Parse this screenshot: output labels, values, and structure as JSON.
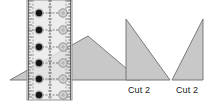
{
  "canvas": {
    "width": 215,
    "height": 106,
    "background": "#ffffff"
  },
  "palette": {
    "piece_fill": "#c8c8c8",
    "piece_stroke": "#6e6e6e",
    "ruler_fill": "#e9e9e9",
    "ruler_stroke": "#8d8d8d",
    "ruler_tick": "#4a4a4a",
    "grid_line": "#5a5a5a",
    "marker_dark_fill": "#141414",
    "marker_dark_ring": "#6a6a6a",
    "marker_light_fill": "#d2d2d2",
    "marker_light_ring": "#8a8a8a",
    "text": "#1a1a1a"
  },
  "diagram": {
    "type": "quilting-cutting-diagram",
    "pieces": [
      {
        "name": "obtuse-triangle-under-ruler",
        "shape": "triangle",
        "points": "10,80 88,36 140,80",
        "fill": "#c8c8c8",
        "stroke": "#6e6e6e"
      },
      {
        "name": "cut-triangle-middle",
        "shape": "right-triangle",
        "points": "126,19 126,80 170,80",
        "right_angle": "bottom-left",
        "fill": "#c8c8c8",
        "stroke": "#6e6e6e",
        "label": "Cut 2"
      },
      {
        "name": "cut-triangle-right",
        "shape": "right-triangle",
        "points": "203,19 203,80 172,80",
        "right_angle": "bottom-right",
        "fill": "#c8c8c8",
        "stroke": "#6e6e6e",
        "label": "Cut 2"
      }
    ],
    "ruler": {
      "name": "acrylic-ruler",
      "x": 27,
      "y": 0,
      "width": 45,
      "height": 100,
      "fill": "#e9e9e9",
      "stroke": "#8d8d8d",
      "vertical_guide_lines_x": [
        33,
        50,
        66
      ],
      "tick_columns_x": [
        29,
        70
      ],
      "tick_spacing": 3
    },
    "markers": {
      "row_y": [
        13,
        30,
        47,
        63,
        79,
        95
      ],
      "dark_column_x": 39,
      "light_column_x": 63,
      "dark_radius": 4.6,
      "light_radius": 4.2,
      "connector": "dashed-horizontal"
    }
  },
  "labels": {
    "cut2_middle": "Cut 2",
    "cut2_right": "Cut 2"
  }
}
